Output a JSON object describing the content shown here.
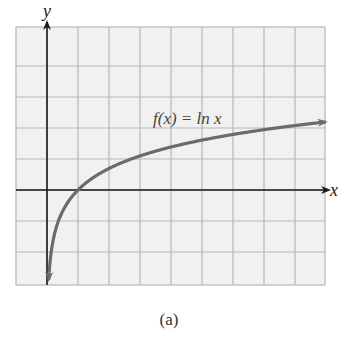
{
  "chart_data": {
    "type": "line",
    "title": "",
    "function_label": "f(x) = ln x",
    "xlabel": "x",
    "ylabel": "y",
    "xlim": [
      -1,
      9
    ],
    "ylim": [
      -3,
      5
    ],
    "grid": true,
    "tick_labels": false,
    "series": [
      {
        "name": "f(x) = ln x",
        "x": [
          0.05,
          0.1,
          0.2,
          0.5,
          1,
          2,
          2.718,
          4,
          6,
          9
        ],
        "y": [
          -3.0,
          -2.3,
          -1.61,
          -0.69,
          0,
          0.69,
          1,
          1.39,
          1.79,
          2.2
        ]
      }
    ],
    "colors": {
      "curve": "#6b6b6b",
      "axes": "#1a1a1a",
      "grid": "#b8b8b8",
      "background": "#f2f2f2"
    }
  },
  "labels": {
    "function": "f(x) = ln x",
    "x_axis": "x",
    "y_axis": "y",
    "caption": "(a)"
  }
}
